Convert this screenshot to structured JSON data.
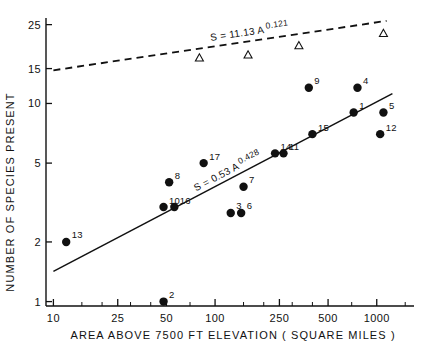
{
  "figure": {
    "background_color": "#ffffff",
    "ink_color": "#111111"
  },
  "chart_data": {
    "type": "scatter",
    "title": "",
    "xlabel": "AREA  ABOVE  7500 FT  ELEVATION  ( SQUARE  MILES )",
    "ylabel": "NUMBER OF SPECIES PRESENT",
    "xscale": "log",
    "yscale": "log",
    "xlim": [
      9,
      1700
    ],
    "ylim": [
      0.95,
      27
    ],
    "grid": false,
    "legend": "none",
    "xticks": [
      10,
      25,
      50,
      100,
      250,
      500,
      1000
    ],
    "xticklabels": [
      "10",
      "25",
      "50",
      "100",
      "250",
      "500",
      "1000"
    ],
    "yticks": [
      1,
      2,
      5,
      10,
      15,
      25
    ],
    "yticklabels": [
      "1",
      "2",
      "5",
      "10",
      "15",
      "25"
    ],
    "series": [
      {
        "name": "mountaintop-islands",
        "marker": "filled-circle",
        "points": [
          {
            "label": "13",
            "area": 12,
            "species": 2.0
          },
          {
            "label": "2",
            "area": 48,
            "species": 1.0
          },
          {
            "label": "10",
            "area": 48,
            "species": 3.0
          },
          {
            "label": "16",
            "area": 56,
            "species": 3.0
          },
          {
            "label": "8",
            "area": 52,
            "species": 4.0
          },
          {
            "label": "17",
            "area": 85,
            "species": 5.0
          },
          {
            "label": "3",
            "area": 125,
            "species": 2.8
          },
          {
            "label": "6",
            "area": 145,
            "species": 2.8
          },
          {
            "label": "7",
            "area": 150,
            "species": 3.8
          },
          {
            "label": "14",
            "area": 235,
            "species": 5.6
          },
          {
            "label": "11",
            "area": 265,
            "species": 5.6
          },
          {
            "label": "15",
            "area": 400,
            "species": 7.0
          },
          {
            "label": "9",
            "area": 380,
            "species": 12.0
          },
          {
            "label": "4",
            "area": 760,
            "species": 12.0
          },
          {
            "label": "1",
            "area": 720,
            "species": 9.0
          },
          {
            "label": "5",
            "area": 1100,
            "species": 9.0
          },
          {
            "label": "12",
            "area": 1050,
            "species": 7.0
          }
        ]
      },
      {
        "name": "mainland-reference",
        "marker": "open-triangle",
        "points": [
          {
            "label": "",
            "area": 80,
            "species": 17.0
          },
          {
            "label": "",
            "area": 160,
            "species": 17.6
          },
          {
            "label": "",
            "area": 330,
            "species": 19.6
          },
          {
            "label": "",
            "area": 1100,
            "species": 22.6
          }
        ]
      }
    ],
    "fits": [
      {
        "name": "island-regression",
        "style": "solid",
        "equation_text": "S = 0.53 A",
        "equation_exponent": "0.428",
        "coefficient": 0.53,
        "exponent": 0.428,
        "x_start": 10,
        "x_end": 1250
      },
      {
        "name": "mainland-regression",
        "style": "dashed",
        "equation_text": "S = 11.13 A",
        "equation_exponent": "0.121",
        "coefficient": 11.13,
        "exponent": 0.121,
        "x_start": 10,
        "x_end": 1150
      }
    ]
  }
}
